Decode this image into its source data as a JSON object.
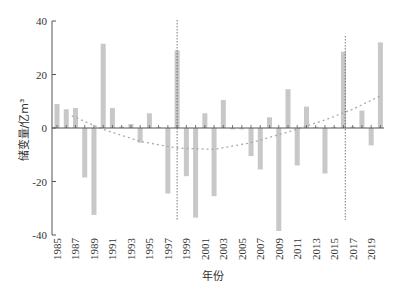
{
  "chart_data": {
    "type": "bar",
    "title": "",
    "xlabel": "年份",
    "ylabel": "储变量/亿m³",
    "ylim": [
      -40,
      40
    ],
    "yticks": [
      40,
      20,
      0,
      -20,
      -40
    ],
    "xtick_labels": [
      "1985",
      "1987",
      "1989",
      "1991",
      "1993",
      "1995",
      "1997",
      "1999",
      "2001",
      "2003",
      "2005",
      "2007",
      "2009",
      "2011",
      "2013",
      "2015",
      "2017",
      "2019"
    ],
    "categories": [
      "1985",
      "1986",
      "1987",
      "1988",
      "1989",
      "1990",
      "1991",
      "1992",
      "1993",
      "1994",
      "1995",
      "1996",
      "1997",
      "1998",
      "1999",
      "2000",
      "2001",
      "2002",
      "2003",
      "2004",
      "2005",
      "2006",
      "2007",
      "2008",
      "2009",
      "2010",
      "2011",
      "2012",
      "2013",
      "2014",
      "2015",
      "2016",
      "2017",
      "2018",
      "2019",
      "2020"
    ],
    "values": [
      9,
      7,
      7.5,
      -18.5,
      -32.5,
      31.5,
      7.5,
      0.5,
      1.5,
      -5.5,
      5.5,
      0.3,
      -24.5,
      29,
      -18,
      -33.5,
      5.5,
      -25.5,
      10.5,
      -0.5,
      -0.5,
      -10.5,
      -15.5,
      4,
      -38.5,
      14.5,
      -14,
      8,
      0.3,
      -17,
      0.3,
      28.5,
      0.5,
      6.5,
      -6.5,
      32
    ],
    "trend_curve": {
      "style": "dotted",
      "points": [
        [
          1986.6,
          4.5
        ],
        [
          1990,
          -0.5
        ],
        [
          1994,
          -5
        ],
        [
          1998,
          -7.5
        ],
        [
          2002,
          -8
        ],
        [
          2006,
          -5.5
        ],
        [
          2010,
          -1.5
        ],
        [
          2014,
          3
        ],
        [
          2017,
          7
        ],
        [
          2020,
          12
        ]
      ]
    },
    "reference_lines": [
      {
        "year": 1998,
        "style": "dotted"
      },
      {
        "year": 2016.2,
        "style": "dotted"
      }
    ],
    "grid": false,
    "legend": null,
    "bar_color": "#c8c8c8",
    "axis_color": "#555555"
  }
}
